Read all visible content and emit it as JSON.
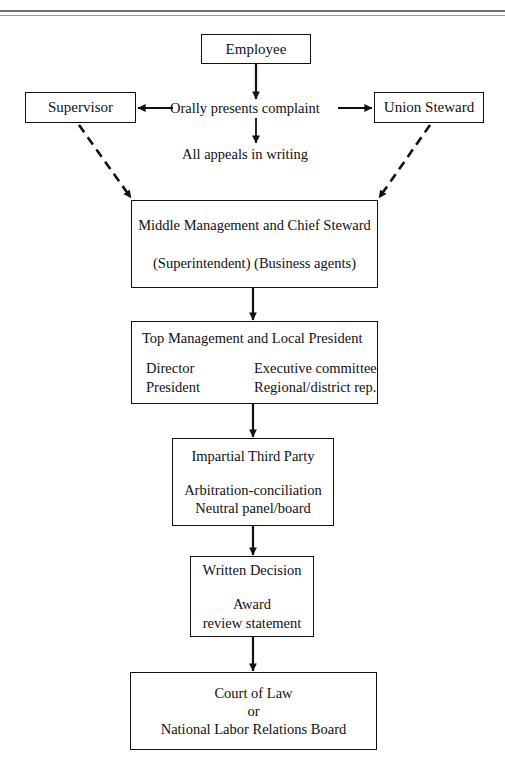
{
  "page": {
    "background": "#ffffff",
    "ink": "#111111"
  },
  "nodes": {
    "employee": {
      "line1": "Employee"
    },
    "supervisor": {
      "line1": "Supervisor"
    },
    "steward": {
      "line1": "Union Steward"
    },
    "middle": {
      "line1": "Middle Management and Chief Steward",
      "line2": "(Superintendent) (Business agents)"
    },
    "top": {
      "title": "Top Management and Local President",
      "col_left_1": "Director",
      "col_left_2": "President",
      "col_right_1": "Executive committee",
      "col_right_2": "Regional/district rep."
    },
    "third": {
      "line1": "Impartial Third Party",
      "line2": "Arbitration-conciliation",
      "line3": "Neutral panel/board"
    },
    "written": {
      "line1": "Written Decision",
      "line2": "Award",
      "line3": "review statement"
    },
    "court": {
      "line1": "Court of Law",
      "line2": "or",
      "line3": "National Labor Relations Board"
    }
  },
  "labels": {
    "orally": "Orally presents complaint",
    "appeals": "All appeals in writing"
  },
  "connectors": [
    {
      "name": "employee-to-center",
      "style": "solid",
      "from": "employee",
      "to": "orally-label"
    },
    {
      "name": "center-to-supervisor",
      "style": "solid",
      "from": "center",
      "to": "supervisor"
    },
    {
      "name": "center-to-steward",
      "style": "solid",
      "from": "center",
      "to": "steward"
    },
    {
      "name": "center-to-appeals",
      "style": "solid",
      "from": "center",
      "to": "appeals-label"
    },
    {
      "name": "supervisor-to-middle",
      "style": "dashed",
      "from": "supervisor",
      "to": "middle"
    },
    {
      "name": "steward-to-middle",
      "style": "dashed",
      "from": "steward",
      "to": "middle"
    },
    {
      "name": "middle-to-top",
      "style": "solid",
      "from": "middle",
      "to": "top"
    },
    {
      "name": "top-to-third",
      "style": "solid",
      "from": "top",
      "to": "third"
    },
    {
      "name": "third-to-written",
      "style": "solid",
      "from": "third",
      "to": "written"
    },
    {
      "name": "written-to-court",
      "style": "solid",
      "from": "written",
      "to": "court"
    }
  ]
}
